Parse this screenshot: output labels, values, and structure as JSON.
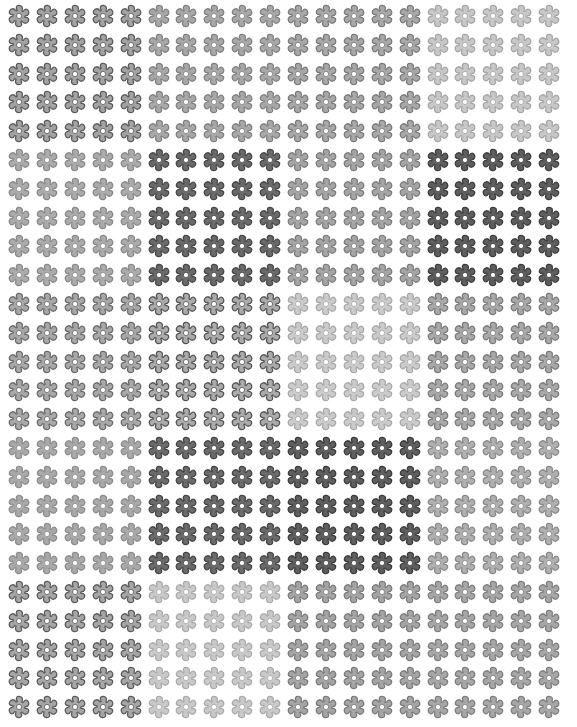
{
  "canvas": {
    "width": 577,
    "height": 727,
    "background": "#ffffff"
  },
  "layout": {
    "block_cols": 4,
    "block_rows": 5,
    "flowers_per_block_x": 5,
    "flowers_per_block_y": 5,
    "origin_x": 19,
    "origin_y": 16,
    "step_x": 27.9,
    "step_y": 28.8,
    "flower_size": 26
  },
  "icon": {
    "name": "flower-icon",
    "petals": 6,
    "center": "#ffffff"
  },
  "blocks": [
    [
      {
        "fill": "#a3a3a3",
        "stroke": "#5a5a5a"
      },
      {
        "fill": "#a8a8a8",
        "stroke": "#808080"
      },
      {
        "fill": "#a8a8a8",
        "stroke": "#7a7a7a"
      },
      {
        "fill": "#c8c8c8",
        "stroke": "#a5a5a5"
      }
    ],
    [
      {
        "fill": "#ababab",
        "stroke": "#888888"
      },
      {
        "fill": "#6a6a6a",
        "stroke": "#474747"
      },
      {
        "fill": "#a5a5a5",
        "stroke": "#7c7c7c"
      },
      {
        "fill": "#5e5e5e",
        "stroke": "#3d3d3d"
      }
    ],
    [
      {
        "fill": "#a8a8a8",
        "stroke": "#6a6a6a"
      },
      {
        "fill": "#ababab",
        "stroke": "#555555"
      },
      {
        "fill": "#cbcbcb",
        "stroke": "#a8a8a8"
      },
      {
        "fill": "#a9a9a9",
        "stroke": "#7a7a7a"
      }
    ],
    [
      {
        "fill": "#a9a9a9",
        "stroke": "#8c8c8c"
      },
      {
        "fill": "#6b6b6b",
        "stroke": "#454545"
      },
      {
        "fill": "#5f5f5f",
        "stroke": "#3b3b3b"
      },
      {
        "fill": "#b0b0b0",
        "stroke": "#888888"
      }
    ],
    [
      {
        "fill": "#a6a6a6",
        "stroke": "#5a5a5a"
      },
      {
        "fill": "#c9c9c9",
        "stroke": "#aaaaaa"
      },
      {
        "fill": "#a5a5a5",
        "stroke": "#7a7a7a"
      },
      {
        "fill": "#a7a7a7",
        "stroke": "#7d7d7d"
      }
    ]
  ]
}
